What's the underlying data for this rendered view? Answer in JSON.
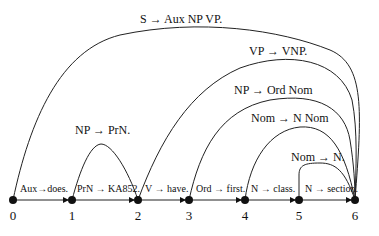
{
  "diagram": {
    "type": "chart-parse",
    "nodes": [
      {
        "id": 0,
        "label": "0",
        "x": 13
      },
      {
        "id": 1,
        "label": "1",
        "x": 72
      },
      {
        "id": 2,
        "label": "2",
        "x": 138
      },
      {
        "id": 3,
        "label": "3",
        "x": 189
      },
      {
        "id": 4,
        "label": "4",
        "x": 245
      },
      {
        "id": 5,
        "label": "5",
        "x": 299
      },
      {
        "id": 6,
        "label": "6",
        "x": 355
      }
    ],
    "lexical_edges": [
      {
        "from": 0,
        "to": 1,
        "label": "Aux→does."
      },
      {
        "from": 1,
        "to": 2,
        "label": "PrN → KA852."
      },
      {
        "from": 2,
        "to": 3,
        "label": "V → have."
      },
      {
        "from": 3,
        "to": 4,
        "label": "Ord → first."
      },
      {
        "from": 4,
        "to": 5,
        "label": "N → class."
      },
      {
        "from": 5,
        "to": 6,
        "label": "N → section."
      }
    ],
    "arcs": [
      {
        "from": 0,
        "to": 6,
        "label": "S → Aux NP VP."
      },
      {
        "from": 2,
        "to": 6,
        "label": "VP → VNP."
      },
      {
        "from": 3,
        "to": 6,
        "label": "NP → Ord Nom"
      },
      {
        "from": 4,
        "to": 6,
        "label": "Nom → N Nom"
      },
      {
        "from": 5,
        "to": 6,
        "label": "Nom → N."
      },
      {
        "from": 1,
        "to": 2,
        "label": "NP → PrN."
      }
    ]
  }
}
